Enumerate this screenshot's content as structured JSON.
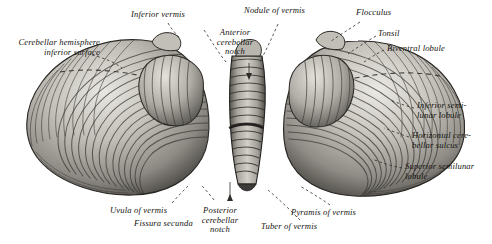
{
  "figure": {
    "style": "engraving",
    "background_color": "#ffffff",
    "ink_color": "#15130f"
  },
  "labels": [
    {
      "id": "cerebellar-hemisphere-inferior-surface",
      "text": "Cerebellar hemisphere\ninferior surface",
      "x": 6,
      "y": 38,
      "align": "left"
    },
    {
      "id": "inferior-vermis",
      "text": "Inferior vermis",
      "x": 131,
      "y": 10,
      "align": "left"
    },
    {
      "id": "anterior-cerebellar-notch",
      "text": "Anterior\ncerebellar\nnotch",
      "x": 207,
      "y": 28,
      "align": "center"
    },
    {
      "id": "nodule-of-vermis",
      "text": "Nodule of vermis",
      "x": 244,
      "y": 6,
      "align": "left"
    },
    {
      "id": "flocculus",
      "text": "Flocculus",
      "x": 356,
      "y": 8,
      "align": "left"
    },
    {
      "id": "tonsil",
      "text": "Tonsil",
      "x": 378,
      "y": 29,
      "align": "left"
    },
    {
      "id": "biventral-lobule",
      "text": "Biventral lobule",
      "x": 387,
      "y": 44,
      "align": "left"
    },
    {
      "id": "inferior-semilunar-lobule",
      "text": "Inferior semi-\nlunar lobule",
      "x": 417,
      "y": 101,
      "align": "left"
    },
    {
      "id": "horizontal-cerebellar-sulcus",
      "text": "Horizontal cere-\nbellar sulcus",
      "x": 412,
      "y": 131,
      "align": "left"
    },
    {
      "id": "superior-semilunar-lobule",
      "text": "Superior semilunar\nlobule",
      "x": 405,
      "y": 162,
      "align": "left"
    },
    {
      "id": "uvula-of-vermis",
      "text": "Uvula of vermis",
      "x": 110,
      "y": 206,
      "align": "left"
    },
    {
      "id": "fissura-secunda",
      "text": "Fissura secunda",
      "x": 134,
      "y": 219,
      "align": "left"
    },
    {
      "id": "posterior-cerebellar-notch",
      "text": "Posterior\ncerebellar\nnotch",
      "x": 219,
      "y": 206,
      "align": "center"
    },
    {
      "id": "pyramis-of-vermis",
      "text": "Pyramis of vermis",
      "x": 291,
      "y": 208,
      "align": "left"
    },
    {
      "id": "tuber-of-vermis",
      "text": "Tuber of vermis",
      "x": 261,
      "y": 222,
      "align": "left"
    }
  ]
}
